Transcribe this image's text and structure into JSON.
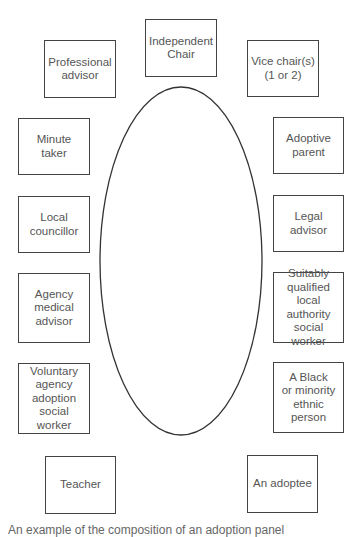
{
  "diagram": {
    "table_shape": "ellipse",
    "members": [
      {
        "id": "independent-chair",
        "label": "Independent\nChair",
        "x": 145,
        "y": 19,
        "w": 72,
        "h": 58
      },
      {
        "id": "professional-advisor",
        "label": "Professional\nadvisor",
        "x": 44,
        "y": 40,
        "w": 72,
        "h": 58
      },
      {
        "id": "vice-chairs",
        "label": "Vice chair(s)\n(1 or 2)",
        "x": 247,
        "y": 40,
        "w": 72,
        "h": 57
      },
      {
        "id": "minute-taker",
        "label": "Minute\ntaker",
        "x": 18,
        "y": 118,
        "w": 72,
        "h": 57
      },
      {
        "id": "adoptive-parent",
        "label": "Adoptive\nparent",
        "x": 273,
        "y": 117,
        "w": 71,
        "h": 57
      },
      {
        "id": "local-councillor",
        "label": "Local\ncouncillor",
        "x": 18,
        "y": 196,
        "w": 72,
        "h": 57
      },
      {
        "id": "legal-advisor",
        "label": "Legal\nadvisor",
        "x": 273,
        "y": 195,
        "w": 71,
        "h": 57
      },
      {
        "id": "agency-medical-advisor",
        "label": "Agency\nmedical\nadvisor",
        "x": 18,
        "y": 273,
        "w": 72,
        "h": 70
      },
      {
        "id": "suitably-qualified-social-worker",
        "label": "Suitably\nqualified local\nauthority\nsocial worker",
        "x": 273,
        "y": 272,
        "w": 71,
        "h": 71
      },
      {
        "id": "voluntary-agency-social-worker",
        "label": "Voluntary\nagency\nadoption\nsocial worker",
        "x": 18,
        "y": 363,
        "w": 72,
        "h": 71
      },
      {
        "id": "black-minority-ethnic-person",
        "label": "A Black\nor minority\nethnic\nperson",
        "x": 273,
        "y": 362,
        "w": 71,
        "h": 71
      },
      {
        "id": "teacher",
        "label": "Teacher",
        "x": 45,
        "y": 456,
        "w": 71,
        "h": 58
      },
      {
        "id": "adoptee",
        "label": "An adoptee",
        "x": 247,
        "y": 455,
        "w": 71,
        "h": 58
      }
    ],
    "ellipse": {
      "cx": 181,
      "cy": 261,
      "rx": 81,
      "ry": 174,
      "stroke": "#333333"
    }
  },
  "caption": "An example of the composition of an adoption panel"
}
